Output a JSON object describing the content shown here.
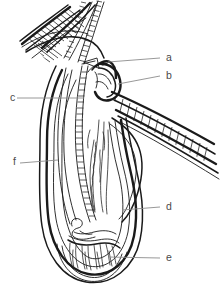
{
  "figure": {
    "kind": "line-diagram",
    "background_color": "#ffffff",
    "ink_color": "#1a1a1a",
    "leader_color": "#8c8c8c",
    "label_color": "#4a4a4a"
  },
  "labels": [
    {
      "id": "a",
      "text": "a",
      "text_x": 166,
      "text_y": 58,
      "leader": "M108,62 L160,58"
    },
    {
      "id": "b",
      "text": "b",
      "text_x": 166,
      "text_y": 76,
      "leader": "M118,84 L160,76"
    },
    {
      "id": "c",
      "text": "c",
      "text_x": 10,
      "text_y": 98,
      "leader": "M17,98 L84,98"
    },
    {
      "id": "d",
      "text": "d",
      "text_x": 166,
      "text_y": 207,
      "leader": "M122,210 L160,207"
    },
    {
      "id": "e",
      "text": "e",
      "text_x": 166,
      "text_y": 258,
      "leader": "M108,257 L160,258"
    },
    {
      "id": "f",
      "text": "f",
      "text_x": 13,
      "text_y": 162,
      "leader": "M20,163 L58,160"
    }
  ],
  "parts": {
    "hair_shaft": "hair-shaft",
    "epidermis_band": "epidermis-hatched-band",
    "sebaceous_gland": "sebaceous-gland",
    "arrector_muscle_band": "arrector-pili-hatched-band",
    "outer_root_sheath": "outer-root-sheath",
    "inner_root_sheath": "inner-root-sheath",
    "follicle_wall": "follicle-wall",
    "hair_bulb": "hair-bulb",
    "dermal_papilla": "dermal-papilla",
    "matrix": "matrix-region"
  }
}
